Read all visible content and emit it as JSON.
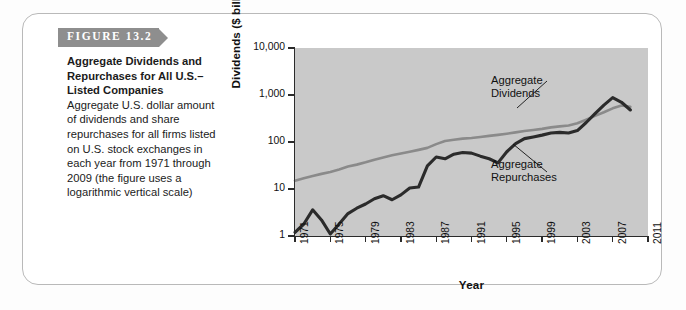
{
  "figure": {
    "banner_label": "FIGURE 13.2",
    "caption_title": "Aggregate Dividends and Repurchases for All U.S.–Listed Companies",
    "caption_body": " Aggregate U.S. dollar amount of dividends and share repurchases for all firms listed on U.S. stock exchanges in each year from 1971 through 2009 (the figure uses a logarithmic vertical scale)"
  },
  "annotations": {
    "dividends": "Aggregate\nDividends",
    "dividends_line1": "Aggregate",
    "dividends_line2": "Dividends",
    "repurchases_line1": "Aggregate",
    "repurchases_line2": "Repurchases"
  },
  "colors": {
    "banner": "#8e8e8e",
    "plot_background": "#c9c9c9",
    "dividends_line": "#8a8a8a",
    "repurchases_line": "#2b2b2b",
    "axis": "#2b2b2b",
    "card_border": "#b9b9b9"
  },
  "chart_data": {
    "type": "line",
    "title": "Aggregate Dividends and Repurchases for All U.S.–Listed Companies",
    "xlabel": "Year",
    "ylabel": "Dividends ($ billions)",
    "yscale": "log",
    "ylim": [
      1,
      10000
    ],
    "ytick_labels": [
      "10,000",
      "1,000",
      "100",
      "10",
      "1"
    ],
    "ytick_values": [
      10000,
      1000,
      100,
      10,
      1
    ],
    "xlim": [
      1971,
      2011
    ],
    "xtick_labels": [
      "1971",
      "1975",
      "1979",
      "1983",
      "1987",
      "1991",
      "1995",
      "1999",
      "2003",
      "2007",
      "2011"
    ],
    "xtick_values": [
      1971,
      1975,
      1979,
      1983,
      1987,
      1991,
      1995,
      1999,
      2003,
      2007,
      2011
    ],
    "grid": false,
    "legend": "inline annotations",
    "x": [
      1971,
      1972,
      1973,
      1974,
      1975,
      1976,
      1977,
      1978,
      1979,
      1980,
      1981,
      1982,
      1983,
      1984,
      1985,
      1986,
      1987,
      1988,
      1989,
      1990,
      1991,
      1992,
      1993,
      1994,
      1995,
      1996,
      1997,
      1998,
      1999,
      2000,
      2001,
      2002,
      2003,
      2004,
      2005,
      2006,
      2007,
      2008,
      2009
    ],
    "series": [
      {
        "name": "Aggregate Dividends",
        "color": "#8a8a8a",
        "values": [
          15,
          17,
          19,
          21,
          23,
          26,
          30,
          33,
          37,
          42,
          47,
          52,
          57,
          62,
          68,
          75,
          90,
          105,
          112,
          118,
          122,
          128,
          135,
          142,
          150,
          160,
          172,
          180,
          190,
          205,
          215,
          225,
          250,
          300,
          360,
          430,
          520,
          600,
          560
        ]
      },
      {
        "name": "Aggregate Repurchases",
        "color": "#2b2b2b",
        "values": [
          1.2,
          1.8,
          3.6,
          2.2,
          1.1,
          1.8,
          3.0,
          3.9,
          4.8,
          6.2,
          7.2,
          5.9,
          7.5,
          10.5,
          11.0,
          31,
          48,
          44,
          55,
          60,
          58,
          50,
          44,
          36,
          62,
          92,
          118,
          128,
          140,
          155,
          160,
          155,
          175,
          260,
          400,
          610,
          880,
          700,
          480
        ]
      }
    ]
  }
}
